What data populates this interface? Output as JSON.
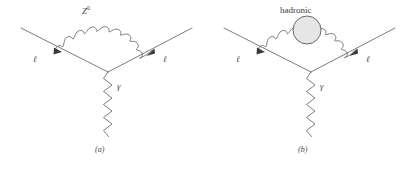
{
  "figure": {
    "type": "feynman-diagrams",
    "background_color": "#ffffff",
    "line_color": "#5a5a5a",
    "blob_fill_color": "#e6e6e6",
    "blob_stroke_color": "#5a5a5a",
    "panel_count": 2
  },
  "diagrams": [
    {
      "id": "a",
      "caption": "(a)",
      "loop_label": "Z",
      "loop_label_superscript": "0",
      "loop_label_full": "Z⁰",
      "loop_type": "wavy-boson-arc",
      "incoming_fermion_label": "ℓ",
      "outgoing_fermion_label": "ℓ",
      "exchange_boson_label": "γ",
      "exchange_boson_type": "zigzag-photon",
      "has_hadronic_blob": false,
      "arrow_count": 2
    },
    {
      "id": "b",
      "caption": "(b)",
      "loop_label": "hadronic",
      "loop_label_superscript": "",
      "loop_label_full": "hadronic",
      "loop_type": "wavy-boson-arc-with-blob",
      "incoming_fermion_label": "ℓ",
      "outgoing_fermion_label": "ℓ",
      "exchange_boson_label": "γ",
      "exchange_boson_type": "zigzag-photon",
      "has_hadronic_blob": true,
      "arrow_count": 2
    }
  ]
}
